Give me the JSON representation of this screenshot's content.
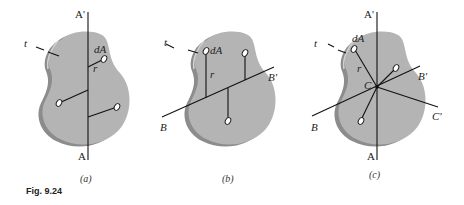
{
  "figure": {
    "caption": "Fig. 9.24",
    "colors": {
      "plate_face": "#b4b4b4",
      "plate_edge": "#8c8c8c",
      "edge_highlight": "#d2d2d2",
      "line": "#111111",
      "background": "#ffffff"
    },
    "panels": [
      {
        "id": "a",
        "label": "(a)",
        "axis_top": "A'",
        "axis_bottom": "A",
        "thickness": "t",
        "element": "dA",
        "radius": "r"
      },
      {
        "id": "b",
        "label": "(b)",
        "axis_right": "B'",
        "axis_left": "B",
        "thickness": "t",
        "element": "dA",
        "radius": "r"
      },
      {
        "id": "c",
        "label": "(c)",
        "axis_top": "A'",
        "axis_bottom": "A",
        "axis_b_right": "B'",
        "axis_b_left": "B",
        "axis_c_right": "C'",
        "center": "C",
        "thickness": "t",
        "element": "dA",
        "radius": "r"
      }
    ]
  }
}
